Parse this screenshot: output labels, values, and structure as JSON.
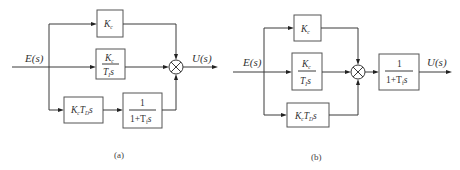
{
  "diagrams": [
    {
      "id": "a",
      "caption": "(a)",
      "input_label": "E(s)",
      "output_label": "U(s)",
      "blocks": {
        "proportional": {
          "text": "Kc",
          "base": "K",
          "sub": "c"
        },
        "integral": {
          "num_base": "K",
          "num_sub": "c",
          "den_base": "T",
          "den_sub": "I",
          "den_tail": "s"
        },
        "derivative": {
          "text": "KcTDs",
          "k": "K",
          "k_sub": "c",
          "t": "T",
          "t_sub": "D",
          "tail": "s"
        },
        "filter": {
          "num": "1",
          "den_pre": "1+T",
          "den_sub": "f",
          "den_tail": "s"
        }
      },
      "structure": "Parallel P, I, and filtered D paths summed"
    },
    {
      "id": "b",
      "caption": "(b)",
      "input_label": "E(s)",
      "output_label": "U(s)",
      "blocks": {
        "proportional": {
          "text": "Kc",
          "base": "K",
          "sub": "c"
        },
        "integral": {
          "num_base": "K",
          "num_sub": "c",
          "den_base": "T",
          "den_sub": "I",
          "den_tail": "s"
        },
        "derivative": {
          "text": "KcTDs",
          "k": "K",
          "k_sub": "c",
          "t": "T",
          "t_sub": "D",
          "tail": "s"
        },
        "filter": {
          "num": "1",
          "den_pre": "1+T",
          "den_sub": "f",
          "den_tail": "s"
        }
      },
      "structure": "Parallel P, I, D paths summed then filtered"
    }
  ]
}
